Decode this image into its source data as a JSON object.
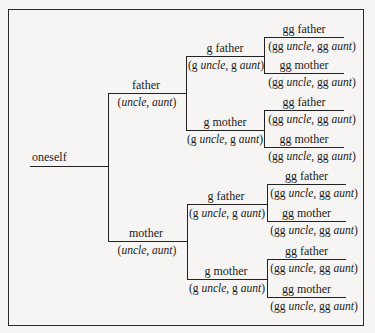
{
  "diagram": {
    "type": "ancestry-tree",
    "root": {
      "label": "oneself"
    },
    "gen1": [
      {
        "label": "father",
        "sub_prefix": "",
        "sub_a": "uncle",
        "sub_b": "aunt"
      },
      {
        "label": "mother",
        "sub_prefix": "",
        "sub_a": "uncle",
        "sub_b": "aunt"
      }
    ],
    "gen2": [
      {
        "label": "g father",
        "pre": "g",
        "sub_a": "uncle",
        "sub_b": "aunt"
      },
      {
        "label": "g mother",
        "pre": "g",
        "sub_a": "uncle",
        "sub_b": "aunt"
      },
      {
        "label": "g father",
        "pre": "g",
        "sub_a": "uncle",
        "sub_b": "aunt"
      },
      {
        "label": "g mother",
        "pre": "g",
        "sub_a": "uncle",
        "sub_b": "aunt"
      }
    ],
    "gen3": [
      {
        "label": "gg father",
        "pre": "gg",
        "sub_a": "uncle",
        "sub_b": "aunt"
      },
      {
        "label": "gg mother",
        "pre": "gg",
        "sub_a": "uncle",
        "sub_b": "aunt"
      },
      {
        "label": "gg father",
        "pre": "gg",
        "sub_a": "uncle",
        "sub_b": "aunt"
      },
      {
        "label": "gg mother",
        "pre": "gg",
        "sub_a": "uncle",
        "sub_b": "aunt"
      },
      {
        "label": "gg father",
        "pre": "gg",
        "sub_a": "uncle",
        "sub_b": "aunt"
      },
      {
        "label": "gg mother",
        "pre": "gg",
        "sub_a": "uncle",
        "sub_b": "aunt"
      },
      {
        "label": "gg father",
        "pre": "gg",
        "sub_a": "uncle",
        "sub_b": "aunt"
      },
      {
        "label": "gg mother",
        "pre": "gg",
        "sub_a": "uncle",
        "sub_b": "aunt"
      }
    ],
    "punct": {
      "open": "(",
      "comma": ", ",
      "close": ")",
      "space": " "
    }
  }
}
